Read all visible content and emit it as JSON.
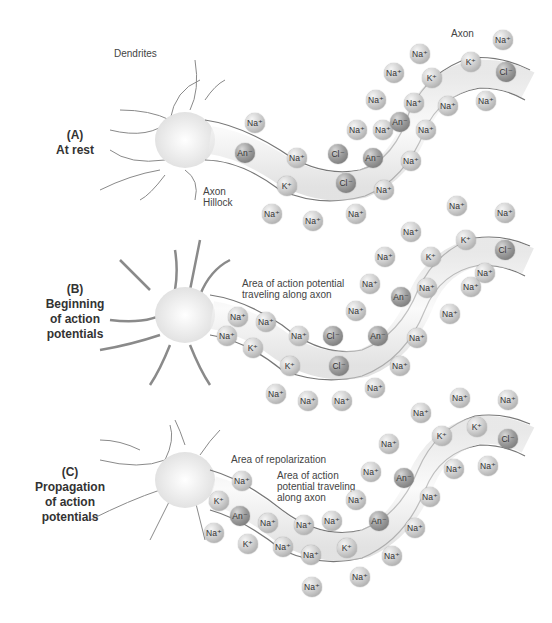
{
  "panels": [
    {
      "id": "A",
      "label_letter": "(A)",
      "label_text": "At rest",
      "annotations": {
        "dendrites": "Dendrites",
        "axon": "Axon",
        "axon_hillock_1": "Axon",
        "axon_hillock_2": "Hillock"
      },
      "ions": [
        {
          "t": "Na+",
          "x": 255,
          "y": 123
        },
        {
          "t": "An-",
          "x": 245,
          "y": 153,
          "d": 1
        },
        {
          "t": "Na+",
          "x": 297,
          "y": 158
        },
        {
          "t": "K+",
          "x": 287,
          "y": 186
        },
        {
          "t": "Cl-",
          "x": 338,
          "y": 154,
          "d": 1
        },
        {
          "t": "Cl-",
          "x": 346,
          "y": 183,
          "d": 1
        },
        {
          "t": "An-",
          "x": 373,
          "y": 158,
          "d": 1
        },
        {
          "t": "Na+",
          "x": 357,
          "y": 130
        },
        {
          "t": "Na+",
          "x": 356,
          "y": 214
        },
        {
          "t": "Na+",
          "x": 272,
          "y": 214
        },
        {
          "t": "Na+",
          "x": 313,
          "y": 221
        },
        {
          "t": "Na+",
          "x": 384,
          "y": 190
        },
        {
          "t": "Na+",
          "x": 383,
          "y": 130
        },
        {
          "t": "Na+",
          "x": 376,
          "y": 100
        },
        {
          "t": "Na+",
          "x": 394,
          "y": 73
        },
        {
          "t": "Na+",
          "x": 420,
          "y": 54
        },
        {
          "t": "An-",
          "x": 400,
          "y": 122,
          "d": 1
        },
        {
          "t": "K+",
          "x": 432,
          "y": 78
        },
        {
          "t": "K+",
          "x": 471,
          "y": 62
        },
        {
          "t": "Cl-",
          "x": 506,
          "y": 72,
          "d": 1
        },
        {
          "t": "Na+",
          "x": 426,
          "y": 130
        },
        {
          "t": "Na+",
          "x": 411,
          "y": 161
        },
        {
          "t": "Na+",
          "x": 448,
          "y": 106
        },
        {
          "t": "Na+",
          "x": 486,
          "y": 101
        },
        {
          "t": "Na+",
          "x": 503,
          "y": 40
        },
        {
          "t": "Na+",
          "x": 414,
          "y": 103
        }
      ]
    },
    {
      "id": "B",
      "label_letter": "(B)",
      "label_text_1": "Beginning",
      "label_text_2": "of action",
      "label_text_3": "potentials",
      "annotations": {
        "line1": "Area of action potential",
        "line2": "traveling along axon"
      },
      "ions": [
        {
          "t": "Na+",
          "x": 238,
          "y": 317
        },
        {
          "t": "Na+",
          "x": 227,
          "y": 336
        },
        {
          "t": "Na+",
          "x": 266,
          "y": 322
        },
        {
          "t": "K+",
          "x": 253,
          "y": 348
        },
        {
          "t": "Na+",
          "x": 299,
          "y": 336
        },
        {
          "t": "K+",
          "x": 290,
          "y": 366
        },
        {
          "t": "Cl-",
          "x": 333,
          "y": 336,
          "d": 1
        },
        {
          "t": "Cl-",
          "x": 339,
          "y": 366,
          "d": 1
        },
        {
          "t": "An-",
          "x": 378,
          "y": 336,
          "d": 1
        },
        {
          "t": "An-",
          "x": 401,
          "y": 297,
          "d": 1
        },
        {
          "t": "Na+",
          "x": 356,
          "y": 311
        },
        {
          "t": "Na+",
          "x": 370,
          "y": 284
        },
        {
          "t": "Na+",
          "x": 385,
          "y": 257
        },
        {
          "t": "Na+",
          "x": 411,
          "y": 232
        },
        {
          "t": "K+",
          "x": 431,
          "y": 257,
          "d": 0
        },
        {
          "t": "K+",
          "x": 466,
          "y": 240
        },
        {
          "t": "Cl-",
          "x": 505,
          "y": 250,
          "d": 1
        },
        {
          "t": "Na+",
          "x": 427,
          "y": 288
        },
        {
          "t": "Na+",
          "x": 450,
          "y": 314
        },
        {
          "t": "Na+",
          "x": 471,
          "y": 287
        },
        {
          "t": "Na+",
          "x": 485,
          "y": 273
        },
        {
          "t": "Na+",
          "x": 417,
          "y": 338
        },
        {
          "t": "Na+",
          "x": 400,
          "y": 366
        },
        {
          "t": "Na+",
          "x": 375,
          "y": 388
        },
        {
          "t": "Na+",
          "x": 276,
          "y": 394
        },
        {
          "t": "Na+",
          "x": 308,
          "y": 401
        },
        {
          "t": "Na+",
          "x": 342,
          "y": 401
        },
        {
          "t": "Na+",
          "x": 457,
          "y": 206
        },
        {
          "t": "Na+",
          "x": 505,
          "y": 213
        }
      ]
    },
    {
      "id": "C",
      "label_letter": "(C)",
      "label_text_1": "Propagation",
      "label_text_2": "of action",
      "label_text_3": "potentials",
      "annotations": {
        "repolarization": "Area of repolarization",
        "line1": "Area of action",
        "line2": "potential traveling",
        "line3": "along axon"
      },
      "ions": [
        {
          "t": "Na+",
          "x": 242,
          "y": 481
        },
        {
          "t": "K+",
          "x": 219,
          "y": 501
        },
        {
          "t": "An-",
          "x": 240,
          "y": 516,
          "d": 1
        },
        {
          "t": "Na+",
          "x": 214,
          "y": 533
        },
        {
          "t": "K+",
          "x": 248,
          "y": 544
        },
        {
          "t": "Na+",
          "x": 268,
          "y": 523
        },
        {
          "t": "Na+",
          "x": 304,
          "y": 525
        },
        {
          "t": "Na+",
          "x": 332,
          "y": 521
        },
        {
          "t": "Na+",
          "x": 283,
          "y": 547
        },
        {
          "t": "Na+",
          "x": 311,
          "y": 555
        },
        {
          "t": "K+",
          "x": 347,
          "y": 548
        },
        {
          "t": "Na+",
          "x": 360,
          "y": 577
        },
        {
          "t": "Na+",
          "x": 312,
          "y": 587
        },
        {
          "t": "An-",
          "x": 379,
          "y": 521,
          "d": 1
        },
        {
          "t": "An-",
          "x": 404,
          "y": 478,
          "d": 1
        },
        {
          "t": "Na+",
          "x": 356,
          "y": 500
        },
        {
          "t": "Na+",
          "x": 371,
          "y": 472
        },
        {
          "t": "Na+",
          "x": 389,
          "y": 444
        },
        {
          "t": "Na+",
          "x": 421,
          "y": 413
        },
        {
          "t": "K+",
          "x": 442,
          "y": 436
        },
        {
          "t": "K+",
          "x": 477,
          "y": 427
        },
        {
          "t": "Cl-",
          "x": 508,
          "y": 439,
          "d": 1
        },
        {
          "t": "Na+",
          "x": 454,
          "y": 469
        },
        {
          "t": "Na+",
          "x": 488,
          "y": 466
        },
        {
          "t": "Na+",
          "x": 430,
          "y": 497
        },
        {
          "t": "Na+",
          "x": 415,
          "y": 528
        },
        {
          "t": "Na+",
          "x": 392,
          "y": 556
        },
        {
          "t": "Na+",
          "x": 460,
          "y": 398
        },
        {
          "t": "Na+",
          "x": 508,
          "y": 400
        }
      ]
    }
  ],
  "ion_labels": {
    "Na+": "Na⁺",
    "K+": "K⁺",
    "Cl-": "Cl⁻",
    "An-": "An⁻"
  }
}
